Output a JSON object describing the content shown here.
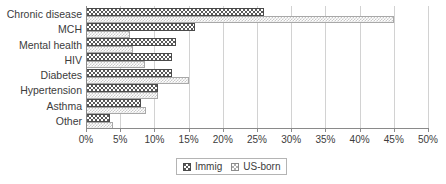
{
  "chart_data": {
    "type": "bar",
    "orientation": "horizontal",
    "title": "",
    "xlabel": "",
    "ylabel": "",
    "xlim": [
      0,
      50
    ],
    "xticks": [
      "0%",
      "5%",
      "10%",
      "15%",
      "20%",
      "25%",
      "30%",
      "35%",
      "40%",
      "45%",
      "50%"
    ],
    "xtick_values": [
      0,
      5,
      10,
      15,
      20,
      25,
      30,
      35,
      40,
      45,
      50
    ],
    "grid": true,
    "legend_position": "bottom",
    "categories": [
      "Chronic disease",
      "MCH",
      "Mental health",
      "HIV",
      "Diabetes",
      "Hypertension",
      "Asthma",
      "Other"
    ],
    "series": [
      {
        "name": "Immig",
        "values": [
          26,
          16,
          13.2,
          12.5,
          12.5,
          10.5,
          8,
          3.5
        ]
      },
      {
        "name": "US-born",
        "values": [
          45,
          6.5,
          6.8,
          8.6,
          15,
          10.5,
          8.8,
          4
        ]
      }
    ]
  },
  "legend": {
    "items": [
      {
        "label": "Immig",
        "pattern": "dark-checker"
      },
      {
        "label": "US-born",
        "pattern": "light-checker"
      }
    ]
  },
  "colors": {
    "immig": "#595959",
    "usborn": "#ffffff",
    "grid": "#d2d2d2",
    "axis": "#8a8a8a",
    "text": "#3c3c3c"
  }
}
